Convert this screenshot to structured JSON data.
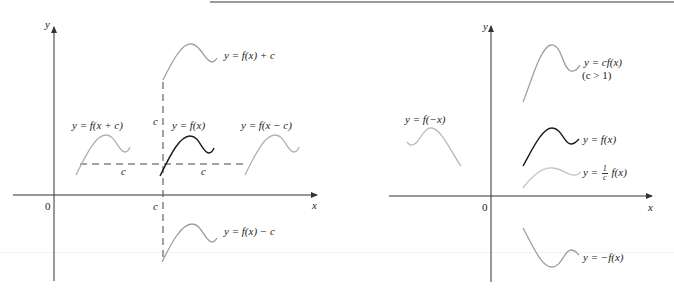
{
  "figure": {
    "left_panel": {
      "axis_labels": {
        "y": "y",
        "x": "x",
        "origin": "0"
      },
      "tick_labels": {
        "c_on_x_axis": "c",
        "c_vertical_shift": "c",
        "c_left_shift": "c",
        "c_right_shift": "c"
      },
      "curves": [
        {
          "id": "f",
          "label": "y = f(x)",
          "color": "#1a1a1a",
          "emphasis": "dark"
        },
        {
          "id": "f_plus_c",
          "label": "y = f(x) + c",
          "color": "#9e9e9e"
        },
        {
          "id": "f_minus_c",
          "label": "y = f(x) − c",
          "color": "#9e9e9e"
        },
        {
          "id": "f_x_plus_c",
          "label": "y = f(x + c)",
          "color": "#b0b0b0"
        },
        {
          "id": "f_x_minus_c",
          "label": "y = f(x − c)",
          "color": "#b0b0b0"
        }
      ]
    },
    "right_panel": {
      "axis_labels": {
        "y": "y",
        "x": "x",
        "origin": "0"
      },
      "curves": [
        {
          "id": "cf",
          "label": "y = cf(x)",
          "note": "(c > 1)",
          "color": "#9e9e9e"
        },
        {
          "id": "f",
          "label": "y = f(x)",
          "color": "#1a1a1a",
          "emphasis": "dark"
        },
        {
          "id": "one_over_c_f",
          "label_prefix": "y =",
          "frac_num": "1",
          "frac_den": "c",
          "label_suffix": "f(x)",
          "color": "#c4c4c4"
        },
        {
          "id": "f_neg_x",
          "label": "y = f(−x)",
          "color": "#b8b8b8"
        },
        {
          "id": "neg_f",
          "label": "y = −f(x)",
          "color": "#9e9e9e"
        }
      ]
    },
    "colors": {
      "dark_curve": "#1a1a1a",
      "gray_curve": "#9e9e9e",
      "light_curve": "#c4c4c4",
      "axis": "#333333"
    }
  }
}
